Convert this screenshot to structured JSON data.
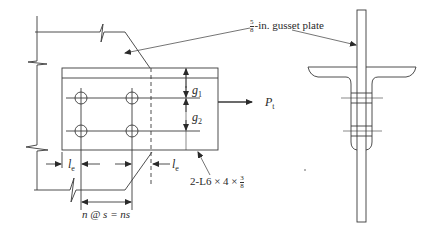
{
  "diagram": {
    "type": "bolted-angle-gusset-connection",
    "views": [
      "elevation",
      "end-section"
    ],
    "colors": {
      "line": "#3a3a3a",
      "background": "#ffffff"
    }
  },
  "labels": {
    "gusset_plate": {
      "num": "5",
      "den": "8",
      "text": "-in. gusset plate"
    },
    "g1": {
      "sym": "g",
      "sub": "1"
    },
    "g2": {
      "sym": "g",
      "sub": "2"
    },
    "force": {
      "sym": "P",
      "sub": "t"
    },
    "le_left": {
      "sym": "l",
      "sub": "e"
    },
    "le_right": {
      "sym": "l",
      "sub": "e"
    },
    "angle": {
      "text": "2-L6 × 4 × ",
      "num": "3",
      "den": "8"
    },
    "spacing": "n @ s = ns"
  }
}
